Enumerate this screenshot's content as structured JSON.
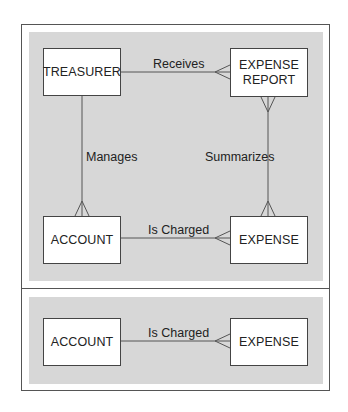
{
  "diagram": {
    "type": "entity-relationship",
    "notation": "crow's foot",
    "panels": [
      {
        "name": "full-model",
        "entities": [
          {
            "id": "treasurer",
            "label": "TREASURER"
          },
          {
            "id": "expense_report",
            "label": "EXPENSE REPORT",
            "lines": [
              "EXPENSE",
              "REPORT"
            ]
          },
          {
            "id": "account",
            "label": "ACCOUNT"
          },
          {
            "id": "expense",
            "label": "EXPENSE"
          }
        ],
        "relationships": [
          {
            "from": "TREASURER",
            "to": "EXPENSE REPORT",
            "label": "Receives",
            "many_end": "EXPENSE REPORT"
          },
          {
            "from": "TREASURER",
            "to": "ACCOUNT",
            "label": "Manages",
            "many_end": "ACCOUNT"
          },
          {
            "from": "EXPENSE",
            "to": "EXPENSE REPORT",
            "label": "Summarizes",
            "many_end": "both"
          },
          {
            "from": "ACCOUNT",
            "to": "EXPENSE",
            "label": "Is Charged",
            "many_end": "EXPENSE"
          }
        ]
      },
      {
        "name": "detail",
        "entities": [
          {
            "id": "account",
            "label": "ACCOUNT"
          },
          {
            "id": "expense",
            "label": "EXPENSE"
          }
        ],
        "relationships": [
          {
            "from": "ACCOUNT",
            "to": "EXPENSE",
            "label": "Is Charged",
            "many_end": "EXPENSE"
          }
        ]
      }
    ],
    "colors": {
      "panel_background": "#d7d7d7",
      "border": "#444444",
      "entity_fill": "#ffffff"
    }
  },
  "top": {
    "treasurer": "TREASURER",
    "expense_report_line1": "EXPENSE",
    "expense_report_line2": "REPORT",
    "account": "ACCOUNT",
    "expense": "EXPENSE",
    "receives": "Receives",
    "manages": "Manages",
    "summarizes": "Summarizes",
    "is_charged": "Is Charged"
  },
  "bottom": {
    "account": "ACCOUNT",
    "expense": "EXPENSE",
    "is_charged": "Is Charged"
  }
}
